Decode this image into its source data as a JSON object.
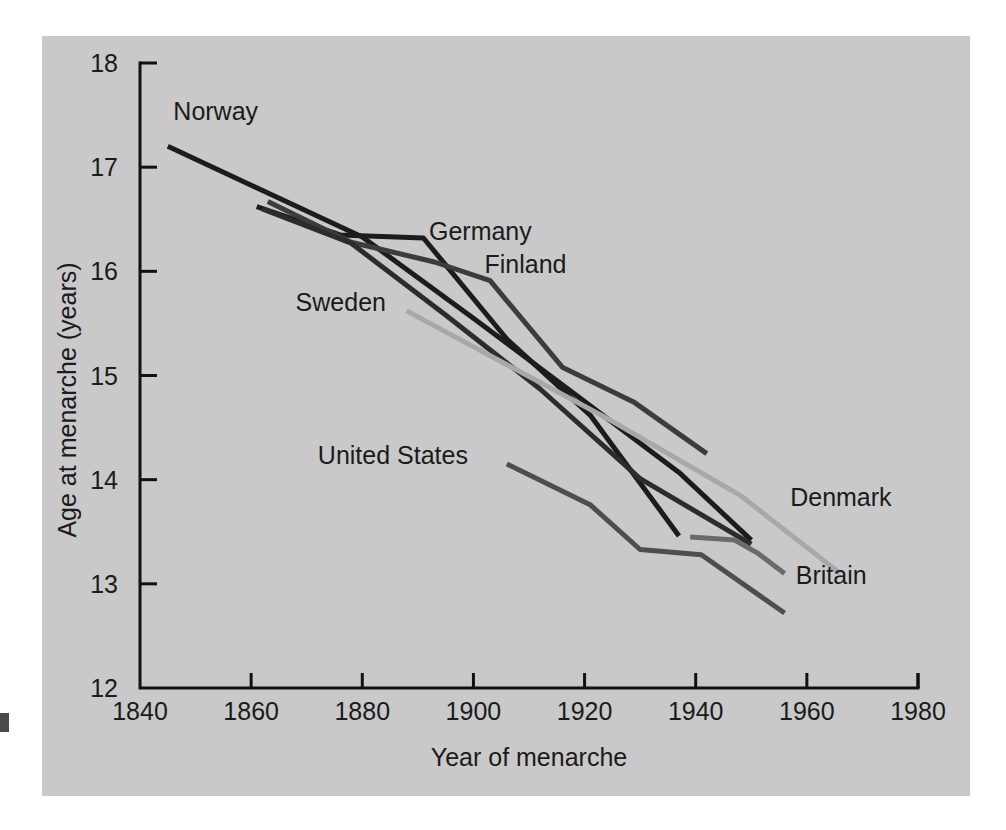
{
  "figure": {
    "background_color": "#ffffff",
    "panel_color": "#c9c9c9"
  },
  "chart_data": {
    "type": "line",
    "title": "",
    "xlabel": "Year of menarche",
    "ylabel": "Age at menarche (years)",
    "xlim": [
      1840,
      1980
    ],
    "ylim": [
      12,
      18
    ],
    "xticks": [
      1840,
      1860,
      1880,
      1900,
      1920,
      1940,
      1960,
      1980
    ],
    "xticklabels": [
      "1840",
      "1860",
      "1880",
      "1900",
      "1920",
      "1940",
      "1960",
      "1980"
    ],
    "yticks": [
      12,
      13,
      14,
      15,
      16,
      17,
      18
    ],
    "yticklabels": [
      "12",
      "13",
      "14",
      "15",
      "16",
      "17",
      "18"
    ],
    "grid": false,
    "legend_position": "inline-labels",
    "series": [
      {
        "name": "Norway",
        "color": "#1c1c1c",
        "width": 5,
        "label_x": 1846,
        "label_y": 17.45,
        "x": [
          1845,
          1880,
          1900,
          1920,
          1937,
          1950
        ],
        "y": [
          17.2,
          16.33,
          15.55,
          14.75,
          14.07,
          13.42
        ]
      },
      {
        "name": "Germany",
        "color": "#1c1c1c",
        "width": 5,
        "label_x": 1892,
        "label_y": 16.3,
        "x": [
          1861,
          1876,
          1891,
          1906,
          1921,
          1937
        ],
        "y": [
          16.62,
          16.35,
          16.32,
          15.35,
          14.62,
          13.46
        ]
      },
      {
        "name": "Finland",
        "color": "#3c3c3c",
        "width": 5,
        "label_x": 1902,
        "label_y": 15.98,
        "x": [
          1863,
          1878,
          1893,
          1903,
          1916,
          1929,
          1942
        ],
        "y": [
          16.67,
          16.28,
          16.09,
          15.91,
          15.08,
          14.74,
          14.25
        ]
      },
      {
        "name": "Sweden",
        "color": "#2c2c2c",
        "width": 5,
        "label_x": 1868,
        "label_y": 15.62,
        "x": [
          1862,
          1878,
          1895,
          1912,
          1930,
          1950
        ],
        "y": [
          16.6,
          16.27,
          15.58,
          14.87,
          14.01,
          13.38
        ]
      },
      {
        "name": "Denmark",
        "color": "#a8a8a8",
        "width": 5,
        "label_x": 1957,
        "label_y": 13.75,
        "x": [
          1888,
          1925,
          1948,
          1966
        ],
        "y": [
          15.62,
          14.56,
          13.85,
          13.1
        ]
      },
      {
        "name": "Britain",
        "color": "#6a6a6a",
        "width": 5,
        "label_x": 1958,
        "label_y": 13.0,
        "x": [
          1939,
          1947,
          1951,
          1956
        ],
        "y": [
          13.45,
          13.42,
          13.3,
          13.1
        ]
      },
      {
        "name": "United States",
        "color": "#4e4e4e",
        "width": 5,
        "label_x": 1872,
        "label_y": 14.15,
        "x": [
          1906,
          1921,
          1930,
          1941,
          1956
        ],
        "y": [
          14.15,
          13.76,
          13.33,
          13.28,
          12.72
        ]
      }
    ]
  }
}
